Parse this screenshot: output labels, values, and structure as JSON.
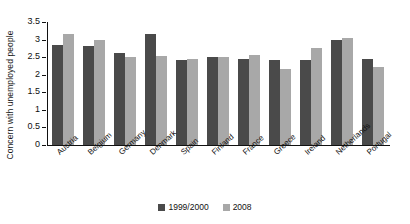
{
  "chart_data": {
    "type": "bar",
    "title": "",
    "xlabel": "",
    "ylabel": "Concern with unemployed people",
    "ylim": [
      0,
      3.5
    ],
    "ytick_labels": [
      "3.5",
      "3",
      "2.5",
      "2",
      "1.5",
      "1",
      "0.5",
      "0"
    ],
    "ytick_values": [
      3.5,
      3,
      2.5,
      2,
      1.5,
      1,
      0.5,
      0
    ],
    "grid": false,
    "legend_position": "bottom-center",
    "categories": [
      "Austria",
      "Belgium",
      "Germany",
      "Denmark",
      "Spain",
      "Finland",
      "France",
      "Greece",
      "Ireland",
      "Netherlands",
      "Portugal"
    ],
    "series": [
      {
        "name": "1999/2000",
        "color": "#4a4a4a",
        "values": [
          2.85,
          2.82,
          2.62,
          3.15,
          2.42,
          2.5,
          2.45,
          2.42,
          2.43,
          3.0,
          2.45
        ]
      },
      {
        "name": "2008",
        "color": "#a8a8a8",
        "values": [
          3.15,
          3.0,
          2.5,
          2.53,
          2.45,
          2.5,
          2.55,
          2.15,
          2.75,
          3.05,
          2.22
        ]
      }
    ]
  },
  "colors": {
    "series_1999_2000": "#4a4a4a",
    "series_2008": "#a8a8a8",
    "axis": "#111111",
    "text": "#111111",
    "background": "#ffffff"
  }
}
